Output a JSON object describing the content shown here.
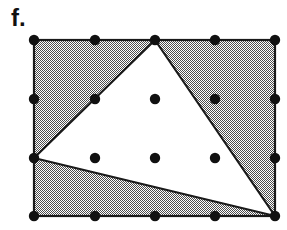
{
  "figure": {
    "label": "f.",
    "caption_position": "top-left",
    "background_color": "#ffffff"
  },
  "colors": {
    "stroke": "#1a1a1a",
    "shaded_fill": "#a0a0a0",
    "shaded_pattern": "checkerboard-dither-50",
    "unshaded_fill": "#ffffff",
    "dot_fill": "#111111",
    "label_color": "#111111"
  },
  "geometry": {
    "rectangle": {
      "name": "bounding-rectangle",
      "x": 34,
      "y": 40,
      "width": 241,
      "height": 176,
      "stroke_width": 2.2,
      "corners": [
        [
          34,
          40
        ],
        [
          275,
          40
        ],
        [
          275,
          216
        ],
        [
          34,
          216
        ]
      ]
    },
    "triangle": {
      "name": "inscribed-triangle",
      "fill": "#ffffff",
      "stroke_width": 2.2,
      "vertices": [
        {
          "label": "apex",
          "x": 155,
          "y": 40
        },
        {
          "label": "left",
          "x": 34,
          "y": 158
        },
        {
          "label": "bottom-right",
          "x": 275,
          "y": 216
        }
      ]
    },
    "shaded_region": {
      "name": "rectangle-minus-triangle",
      "description": "Region of the rectangle outside the triangle, filled with a 50% checkerboard dither."
    }
  },
  "lattice": {
    "description": "Grid of lattice points drawn as filled black dots",
    "columns_x": [
      34,
      95,
      155,
      215,
      275
    ],
    "rows_y": [
      40,
      99,
      158,
      216
    ],
    "dot_radius": 5.2,
    "points": [
      {
        "x": 34,
        "y": 40,
        "on": "rectangle-corner"
      },
      {
        "x": 95,
        "y": 40,
        "on": "rectangle-top-edge"
      },
      {
        "x": 155,
        "y": 40,
        "on": "triangle-apex"
      },
      {
        "x": 215,
        "y": 40,
        "on": "rectangle-top-edge"
      },
      {
        "x": 275,
        "y": 40,
        "on": "rectangle-corner"
      },
      {
        "x": 34,
        "y": 99,
        "on": "rectangle-left-edge"
      },
      {
        "x": 95,
        "y": 99,
        "on": "triangle-edge"
      },
      {
        "x": 155,
        "y": 99,
        "on": "triangle-interior"
      },
      {
        "x": 215,
        "y": 99,
        "on": "shaded-region"
      },
      {
        "x": 275,
        "y": 99,
        "on": "rectangle-right-edge"
      },
      {
        "x": 34,
        "y": 158,
        "on": "triangle-vertex"
      },
      {
        "x": 95,
        "y": 158,
        "on": "triangle-interior"
      },
      {
        "x": 155,
        "y": 158,
        "on": "triangle-interior"
      },
      {
        "x": 215,
        "y": 158,
        "on": "triangle-interior"
      },
      {
        "x": 275,
        "y": 158,
        "on": "rectangle-right-edge"
      },
      {
        "x": 34,
        "y": 216,
        "on": "rectangle-corner"
      },
      {
        "x": 95,
        "y": 216,
        "on": "rectangle-bottom-edge"
      },
      {
        "x": 155,
        "y": 216,
        "on": "rectangle-bottom-edge"
      },
      {
        "x": 215,
        "y": 216,
        "on": "rectangle-bottom-edge"
      },
      {
        "x": 275,
        "y": 216,
        "on": "triangle-vertex"
      }
    ]
  }
}
